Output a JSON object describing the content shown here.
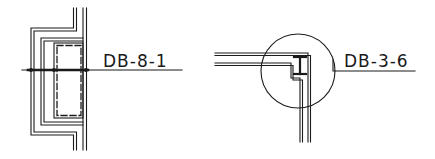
{
  "drawing": {
    "background": "#ffffff",
    "ink": "#1a1a1a",
    "details": [
      {
        "id": "left-detail",
        "description": "Wall section with dashed column pocket",
        "label": "DB-8-1"
      },
      {
        "id": "right-detail",
        "description": "Corner wall junction with steel I-beam in circled callout",
        "label": "DB-3-6"
      }
    ]
  }
}
